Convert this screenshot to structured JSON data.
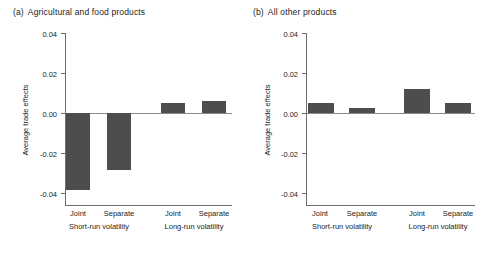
{
  "figure": {
    "ylabel": "Average trade effects",
    "bar_color": "#4d4d4d",
    "axis_color": "#6e6e6e"
  },
  "panels": [
    {
      "tag": "(a)",
      "title": "Agricultural and food products",
      "ylabel": "Average trade effects",
      "yticks": [
        "0.04",
        "0.02",
        "0.00",
        "-0.02",
        "-0.04"
      ],
      "group_labels": [
        "Short-run volatility",
        "Long-run volatility"
      ],
      "bar_labels": [
        "Joint",
        "Separate",
        "Joint",
        "Separate"
      ]
    },
    {
      "tag": "(b)",
      "title": "All other products",
      "ylabel": "Average trade effects",
      "yticks": [
        "0.04",
        "0.02",
        "0.00",
        "-0.02",
        "-0.04"
      ],
      "group_labels": [
        "Short-run volatility",
        "Long-run volatility"
      ],
      "bar_labels": [
        "Joint",
        "Separate",
        "Joint",
        "Separate"
      ]
    }
  ],
  "chart_data": [
    {
      "type": "bar",
      "panel": "(a)",
      "title": "Agricultural and food products",
      "xlabel": "",
      "ylabel": "Average trade effects",
      "categories": [
        "Joint",
        "Separate",
        "Joint",
        "Separate"
      ],
      "groups": [
        "Short-run volatility",
        "Short-run volatility",
        "Long-run volatility",
        "Long-run volatility"
      ],
      "values": [
        -0.0385,
        -0.0285,
        0.005,
        0.006
      ],
      "ylim": [
        -0.04,
        0.04
      ],
      "yticks": [
        0.04,
        0.02,
        0.0,
        -0.02,
        -0.04
      ],
      "grid": false,
      "legend": "none"
    },
    {
      "type": "bar",
      "panel": "(b)",
      "title": "All other products",
      "xlabel": "",
      "ylabel": "Average trade effects",
      "categories": [
        "Joint",
        "Separate",
        "Joint",
        "Separate"
      ],
      "groups": [
        "Short-run volatility",
        "Short-run volatility",
        "Long-run volatility",
        "Long-run volatility"
      ],
      "values": [
        0.005,
        0.0025,
        0.012,
        0.005
      ],
      "ylim": [
        -0.04,
        0.04
      ],
      "yticks": [
        0.04,
        0.02,
        0.0,
        -0.02,
        -0.04
      ],
      "grid": false,
      "legend": "none"
    }
  ]
}
